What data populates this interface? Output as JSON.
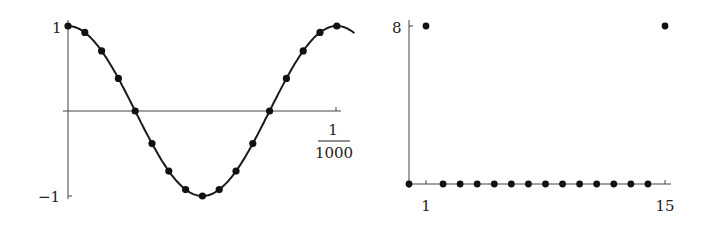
{
  "chart_data": [
    {
      "type": "line",
      "title": "",
      "description": "Sampled cosine wave: smooth curve with 17 sample points over one period",
      "xlabel": "",
      "ylabel": "",
      "x_tick_labels": [
        {
          "numerator": "1",
          "denominator": "1000"
        }
      ],
      "y_tick_labels": [
        "1",
        "−1"
      ],
      "ylim": [
        -1,
        1
      ],
      "xlim": [
        0,
        0.001
      ],
      "grid": false,
      "legend": null,
      "series": [
        {
          "name": "cos(2π·1000·t) samples",
          "x_index": [
            0,
            1,
            2,
            3,
            4,
            5,
            6,
            7,
            8,
            9,
            10,
            11,
            12,
            13,
            14,
            15,
            16
          ],
          "values": [
            1.0,
            0.924,
            0.707,
            0.383,
            0.0,
            -0.383,
            -0.707,
            -0.924,
            -1.0,
            -0.924,
            -0.707,
            -0.383,
            0.0,
            0.383,
            0.707,
            0.924,
            1.0
          ]
        }
      ]
    },
    {
      "type": "scatter",
      "title": "",
      "description": "Discrete spectrum (stem-like dots): nonzero at k=1 and k=15",
      "xlabel": "",
      "ylabel": "",
      "x_tick_labels": [
        "1",
        "15"
      ],
      "y_tick_labels": [
        "8"
      ],
      "xlim": [
        0,
        15
      ],
      "ylim": [
        0,
        8
      ],
      "grid": false,
      "legend": null,
      "series": [
        {
          "name": "magnitude",
          "x": [
            0,
            1,
            2,
            3,
            4,
            5,
            6,
            7,
            8,
            9,
            10,
            11,
            12,
            13,
            14,
            15
          ],
          "values": [
            0,
            8,
            0,
            0,
            0,
            0,
            0,
            0,
            0,
            0,
            0,
            0,
            0,
            0,
            0,
            8
          ]
        }
      ]
    }
  ],
  "left": {
    "y_top_label": "1",
    "y_bottom_label": "−1",
    "x_label_num": "1",
    "x_label_den": "1000"
  },
  "right": {
    "y_top_label": "8",
    "x_left_label": "1",
    "x_right_label": "15"
  }
}
